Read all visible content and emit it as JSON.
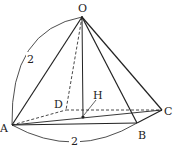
{
  "diagram": {
    "colors": {
      "stroke": "#222222",
      "background": "#ffffff"
    },
    "vertices": {
      "O": {
        "label": "O",
        "x": 82,
        "y": 17
      },
      "A": {
        "label": "A",
        "x": 12,
        "y": 125
      },
      "B": {
        "label": "B",
        "x": 137,
        "y": 123
      },
      "C": {
        "label": "C",
        "x": 162,
        "y": 110
      },
      "D": {
        "label": "D",
        "x": 66,
        "y": 110
      },
      "H": {
        "label": "H",
        "x": 83,
        "y": 117
      }
    },
    "edges_solid": [
      "OA",
      "OB",
      "OC",
      "AB",
      "BC",
      "AC",
      "OH"
    ],
    "edges_dashed": [
      "OD",
      "AD",
      "DC"
    ],
    "dimensions": [
      {
        "edge": "OA",
        "label": "2"
      },
      {
        "edge": "AB",
        "label": "2"
      }
    ]
  }
}
